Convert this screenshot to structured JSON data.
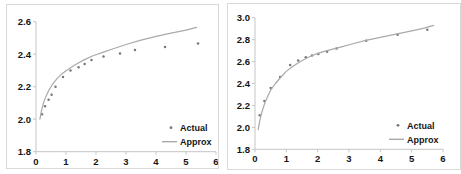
{
  "colors": {
    "approx_line": "#a9a9a9",
    "actual_dot": "#787878",
    "axis_line": "#c6c6c6",
    "tick_text": "#151515",
    "panel_border": "#d9d9d9",
    "background": "#ffffff"
  },
  "legend_labels": {
    "actual": "Actual",
    "approx": "Approx"
  },
  "chart_data": [
    {
      "type": "scatter",
      "title": "",
      "xlabel": "",
      "ylabel": "",
      "xlim": [
        0,
        6
      ],
      "ylim": [
        1.8,
        2.6
      ],
      "grid": false,
      "legend_position": "bottom-right",
      "xticks": [
        0,
        1,
        2,
        3,
        4,
        5,
        6
      ],
      "xtick_labels": [
        "0",
        "1",
        "2",
        "3",
        "4",
        "5",
        "6"
      ],
      "yticks": [
        1.8,
        2.0,
        2.2,
        2.4,
        2.6
      ],
      "ytick_labels": [
        "1.8",
        "2.0",
        "2.2",
        "2.4",
        "2.6"
      ],
      "series": [
        {
          "name": "Actual",
          "kind": "scatter",
          "points": [
            [
              0.2,
              2.03
            ],
            [
              0.3,
              2.08
            ],
            [
              0.42,
              2.12
            ],
            [
              0.52,
              2.15
            ],
            [
              0.65,
              2.2
            ],
            [
              0.9,
              2.26
            ],
            [
              1.15,
              2.3
            ],
            [
              1.42,
              2.32
            ],
            [
              1.62,
              2.34
            ],
            [
              1.85,
              2.365
            ],
            [
              2.25,
              2.385
            ],
            [
              2.8,
              2.405
            ],
            [
              3.3,
              2.425
            ],
            [
              4.3,
              2.445
            ],
            [
              5.4,
              2.465
            ]
          ]
        },
        {
          "name": "Approx",
          "kind": "line",
          "points": [
            [
              0.13,
              2.0
            ],
            [
              0.18,
              2.05
            ],
            [
              0.25,
              2.1
            ],
            [
              0.33,
              2.14
            ],
            [
              0.42,
              2.175
            ],
            [
              0.55,
              2.215
            ],
            [
              0.7,
              2.25
            ],
            [
              0.9,
              2.285
            ],
            [
              1.1,
              2.31
            ],
            [
              1.35,
              2.34
            ],
            [
              1.6,
              2.365
            ],
            [
              1.9,
              2.39
            ],
            [
              2.2,
              2.41
            ],
            [
              2.6,
              2.435
            ],
            [
              3.0,
              2.46
            ],
            [
              3.5,
              2.487
            ],
            [
              4.0,
              2.51
            ],
            [
              4.5,
              2.53
            ],
            [
              5.0,
              2.548
            ],
            [
              5.35,
              2.565
            ]
          ]
        }
      ]
    },
    {
      "type": "scatter",
      "title": "",
      "xlabel": "",
      "ylabel": "",
      "xlim": [
        0,
        6
      ],
      "ylim": [
        1.8,
        3.0
      ],
      "grid": false,
      "legend_position": "bottom-right",
      "xticks": [
        0,
        1,
        2,
        3,
        4,
        5,
        6
      ],
      "xtick_labels": [
        "0",
        "1",
        "2",
        "3",
        "4",
        "5",
        "6"
      ],
      "yticks": [
        1.8,
        2.0,
        2.2,
        2.4,
        2.6,
        2.8,
        3.0
      ],
      "ytick_labels": [
        "1.8",
        "2.0",
        "2.2",
        "2.4",
        "2.6",
        "2.8",
        "3.0"
      ],
      "series": [
        {
          "name": "Actual",
          "kind": "scatter",
          "points": [
            [
              0.15,
              2.11
            ],
            [
              0.3,
              2.24
            ],
            [
              0.5,
              2.36
            ],
            [
              0.8,
              2.46
            ],
            [
              1.12,
              2.57
            ],
            [
              1.38,
              2.61
            ],
            [
              1.62,
              2.64
            ],
            [
              1.82,
              2.655
            ],
            [
              2.02,
              2.67
            ],
            [
              2.3,
              2.69
            ],
            [
              2.6,
              2.72
            ],
            [
              3.55,
              2.79
            ],
            [
              4.55,
              2.845
            ],
            [
              5.5,
              2.89
            ]
          ]
        },
        {
          "name": "Approx",
          "kind": "line",
          "points": [
            [
              0.1,
              1.98
            ],
            [
              0.15,
              2.06
            ],
            [
              0.22,
              2.14
            ],
            [
              0.3,
              2.21
            ],
            [
              0.4,
              2.28
            ],
            [
              0.5,
              2.34
            ],
            [
              0.65,
              2.4
            ],
            [
              0.8,
              2.45
            ],
            [
              1.0,
              2.51
            ],
            [
              1.2,
              2.555
            ],
            [
              1.45,
              2.6
            ],
            [
              1.7,
              2.64
            ],
            [
              2.0,
              2.675
            ],
            [
              2.3,
              2.7
            ],
            [
              2.7,
              2.73
            ],
            [
              3.1,
              2.76
            ],
            [
              3.5,
              2.79
            ],
            [
              4.0,
              2.82
            ],
            [
              4.5,
              2.85
            ],
            [
              5.0,
              2.88
            ],
            [
              5.4,
              2.905
            ],
            [
              5.7,
              2.93
            ]
          ]
        }
      ]
    }
  ]
}
